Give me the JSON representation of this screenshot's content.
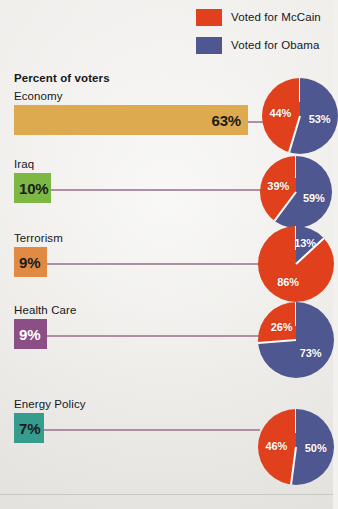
{
  "legend": {
    "items": [
      {
        "label": "Voted for McCain",
        "color": "#e0401c",
        "name": "mccain"
      },
      {
        "label": "Voted for Obama",
        "color": "#4f5791",
        "name": "obama"
      }
    ]
  },
  "column_header": "Percent of voters",
  "chart_data": {
    "type": "bar",
    "title": "Percent of voters",
    "xlabel": "",
    "ylabel": "",
    "categories": [
      "Economy",
      "Iraq",
      "Terrorism",
      "Health Care",
      "Energy Policy"
    ],
    "values": [
      63,
      10,
      9,
      9,
      7
    ],
    "value_labels": [
      "63%",
      "10%",
      "9%",
      "9%",
      "7%"
    ],
    "bar_colors": [
      "#ddaa4f",
      "#7cb843",
      "#e08a43",
      "#8b4f86",
      "#359c8e"
    ],
    "value_text_colors": [
      "#1b1b1b",
      "#1b1b1b",
      "#1b1b1b",
      "#ffffff",
      "#1b1b1b"
    ],
    "xlim": [
      0,
      63
    ],
    "grid": false,
    "legend_position": "top-right",
    "pies": {
      "type": "pie",
      "slice_labels": [
        "Voted for McCain",
        "Voted for Obama"
      ],
      "slice_colors": [
        "#e0401c",
        "#4f5791"
      ],
      "charts": [
        {
          "category": "Economy",
          "mccain": 44,
          "obama": 53,
          "mccain_label": "44%",
          "obama_label": "53%"
        },
        {
          "category": "Iraq",
          "mccain": 39,
          "obama": 59,
          "mccain_label": "39%",
          "obama_label": "59%"
        },
        {
          "category": "Terrorism",
          "mccain": 86,
          "obama": 13,
          "mccain_label": "86%",
          "obama_label": "13%"
        },
        {
          "category": "Health Care",
          "mccain": 26,
          "obama": 73,
          "mccain_label": "26%",
          "obama_label": "73%"
        },
        {
          "category": "Energy Policy",
          "mccain": 46,
          "obama": 50,
          "mccain_label": "46%",
          "obama_label": "50%"
        }
      ]
    }
  }
}
